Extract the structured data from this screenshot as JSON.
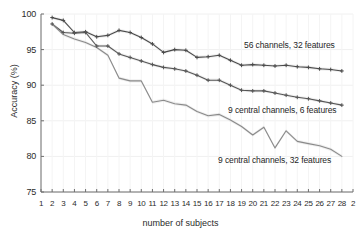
{
  "chart_data": {
    "type": "line",
    "title": "",
    "xlabel": "number of subjects",
    "ylabel": "Accuracy (%)",
    "xlim": [
      1,
      29
    ],
    "ylim": [
      75,
      100
    ],
    "grid": true,
    "legend_position": "inline-annotations",
    "xticks": [
      1,
      2,
      3,
      4,
      5,
      6,
      7,
      8,
      9,
      10,
      11,
      12,
      13,
      14,
      15,
      16,
      17,
      18,
      19,
      20,
      21,
      22,
      23,
      24,
      25,
      26,
      27,
      28,
      29
    ],
    "xtick_labels": [
      "1",
      "2",
      "3",
      "4",
      "5",
      "6",
      "7",
      "8",
      "9",
      "10",
      "11",
      "12",
      "13",
      "14",
      "15",
      "16",
      "17",
      "18",
      "19",
      "20",
      "21",
      "22",
      "23",
      "24",
      "25",
      "26",
      "27",
      "28",
      "2"
    ],
    "yticks": [
      75,
      80,
      85,
      90,
      95,
      100
    ],
    "ytick_labels": [
      "75",
      "80",
      "85",
      "90",
      "95",
      "100"
    ],
    "x": [
      2,
      3,
      4,
      5,
      6,
      7,
      8,
      9,
      10,
      11,
      12,
      13,
      14,
      15,
      16,
      17,
      18,
      19,
      20,
      21,
      22,
      23,
      24,
      25,
      26,
      27,
      28
    ],
    "series": [
      {
        "name": "56 channels, 32 features",
        "color": "#4a4a4a",
        "annotation": "56 channels, 32 features",
        "values": [
          99.5,
          99.1,
          97.4,
          97.5,
          96.8,
          97.0,
          97.7,
          97.4,
          96.7,
          95.8,
          94.6,
          95.0,
          94.9,
          93.9,
          94.0,
          94.2,
          93.5,
          92.8,
          92.9,
          92.8,
          92.7,
          92.8,
          92.6,
          92.5,
          92.3,
          92.2,
          92.0
        ]
      },
      {
        "name": "9 central channels, 6 features",
        "color": "#555555",
        "annotation": "9 central channels, 6 features",
        "values": [
          98.6,
          97.4,
          97.3,
          97.4,
          95.5,
          95.5,
          94.4,
          93.9,
          93.4,
          92.9,
          92.5,
          92.3,
          92.0,
          91.4,
          90.7,
          90.7,
          90.0,
          89.3,
          89.2,
          89.2,
          88.9,
          88.6,
          88.3,
          88.1,
          87.8,
          87.5,
          87.2
        ]
      },
      {
        "name": "9 central channels, 32 features",
        "color": "#8a8a8a",
        "annotation": "9 central channels, 32 features",
        "values": [
          98.6,
          97.1,
          96.5,
          96.0,
          95.3,
          94.2,
          91.0,
          90.6,
          90.6,
          87.6,
          87.9,
          87.4,
          87.2,
          86.3,
          85.7,
          85.9,
          85.1,
          84.2,
          83.0,
          84.1,
          81.2,
          83.6,
          82.1,
          81.8,
          81.5,
          81.0,
          80.0
        ]
      }
    ],
    "shaded_error_band": true
  }
}
